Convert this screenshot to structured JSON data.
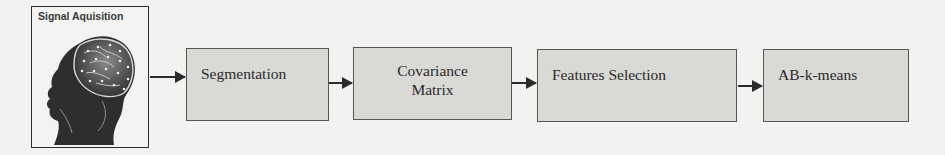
{
  "diagram": {
    "type": "flowchart-pipeline",
    "direction": "left-to-right",
    "colors": {
      "background": "#f4f4f2",
      "box_fill": "#d9d9d6",
      "box_border": "#555555",
      "arrow": "#2a2a2a",
      "text": "#2a2a2a"
    },
    "input_panel": {
      "title": "Signal Aquisition",
      "icon": "head-brain-eeg-icon"
    },
    "steps": [
      {
        "label": "Segmentation"
      },
      {
        "label_line1": "Covariance",
        "label_line2": "Matrix"
      },
      {
        "label": "Features Selection"
      },
      {
        "label": "AB-k-means"
      }
    ],
    "edges": [
      {
        "from": "Signal Aquisition",
        "to": "Segmentation"
      },
      {
        "from": "Segmentation",
        "to": "Covariance Matrix"
      },
      {
        "from": "Covariance Matrix",
        "to": "Features Selection"
      },
      {
        "from": "Features Selection",
        "to": "AB-k-means"
      }
    ]
  }
}
